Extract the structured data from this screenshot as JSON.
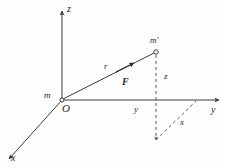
{
  "figure": {
    "kind": "3d-coordinate-vector-diagram",
    "background_color": "#fefefe",
    "stroke_color": "#3a3a3a",
    "axes": {
      "z": {
        "label": "z"
      },
      "y": {
        "label": "y"
      },
      "x": {
        "label": "x"
      }
    },
    "points": {
      "origin": {
        "label": "O"
      },
      "source_mass": {
        "label": "m"
      },
      "test_mass": {
        "label": "m'"
      }
    },
    "vectors": {
      "position": {
        "label": "r"
      },
      "force": {
        "label": "F"
      }
    },
    "components": {
      "z": {
        "label": "z"
      },
      "y": {
        "label": "y"
      },
      "x": {
        "label": "x"
      }
    }
  }
}
